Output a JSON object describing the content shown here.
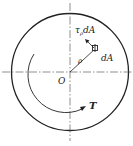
{
  "diagram": {
    "type": "torsion-cross-section",
    "labels": {
      "shear_force": "τ",
      "shear_sub": "ρ",
      "shear_dA": "dA",
      "element_area": "dA",
      "radius": "ρ",
      "center": "O",
      "torque": "T"
    },
    "colors": {
      "stroke": "#222222",
      "background": "#ffffff"
    }
  }
}
